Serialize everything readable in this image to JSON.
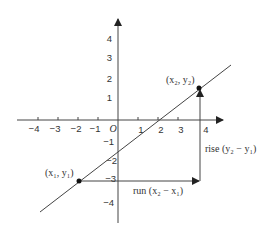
{
  "diagram": {
    "type": "slope-of-line",
    "axes": {
      "origin_label": "O",
      "x_ticks": [
        "-4",
        "-3",
        "-2",
        "-1",
        "1",
        "2",
        "3",
        "4"
      ],
      "y_ticks": [
        "4",
        "3",
        "2",
        "1",
        "-1",
        "-2",
        "-3",
        "-4"
      ],
      "x_tick_display": [
        "−4",
        "−3",
        "−2",
        "−1",
        "1",
        "2",
        "3",
        "4"
      ],
      "y_tick_display": [
        "4",
        "3",
        "2",
        "1",
        "−1",
        "−2",
        "−3",
        "−4"
      ]
    },
    "points": {
      "p1": {
        "label": "(x₁, y₁)",
        "coords": [
          -2,
          -3
        ]
      },
      "p2": {
        "label": "(x₂, y₂)",
        "coords": [
          4,
          1.6
        ]
      }
    },
    "annotations": {
      "rise": "rise (y₂ − y₁)",
      "run": "run (x₂ − x₁)"
    },
    "colors": {
      "stroke": "#333333",
      "background": "#ffffff"
    }
  }
}
